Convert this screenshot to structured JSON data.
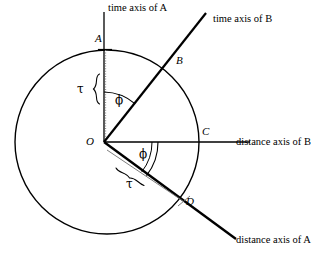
{
  "figure": {
    "type": "geometry-diagram",
    "background_color": "#ffffff",
    "stroke_color": "#000000"
  },
  "geometry": {
    "circle": {
      "cx": 107,
      "cy": 142,
      "r": 92
    },
    "origin": {
      "x": 104,
      "y": 142
    },
    "points": {
      "A": {
        "x": 104,
        "y": 50
      },
      "B": {
        "x": 172,
        "y": 61
      },
      "C": {
        "x": 199,
        "y": 142
      },
      "D": {
        "x": 182,
        "y": 202
      }
    },
    "axes": {
      "time_axis_A": {
        "x1": 104,
        "y1": 142,
        "x2": 104,
        "y2": 12
      },
      "time_axis_B": {
        "x1": 104,
        "y1": 142,
        "x2": 206,
        "y2": 13
      },
      "distance_axis_B": {
        "x1": 104,
        "y1": 142,
        "x2": 250,
        "y2": 142
      },
      "distance_axis_A": {
        "x1": 104,
        "y1": 142,
        "x2": 236,
        "y2": 239
      }
    },
    "angle_phi_degrees": 38
  },
  "labels": {
    "time_axis_a": "time axis of  A",
    "time_axis_b": "time axis of  B",
    "distance_axis_b": "distance axis of  B",
    "distance_axis_a": "distance axis of  A",
    "point_a": "A",
    "point_b": "B",
    "point_c": "C",
    "point_d": "D",
    "origin": "O",
    "phi_upper": "ϕ",
    "phi_lower": "ϕ",
    "tau_upper": "τ",
    "tau_lower": "τ"
  }
}
